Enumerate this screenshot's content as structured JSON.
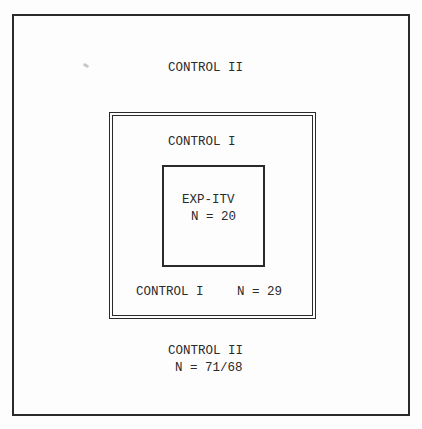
{
  "diagram": {
    "type": "nested-boxes",
    "regions": {
      "outer": {
        "top_label": "CONTROL II",
        "bottom_label": "CONTROL II",
        "bottom_n": "N = 71/68"
      },
      "middle": {
        "top_label": "CONTROL I",
        "bottom_label": "CONTROL I",
        "bottom_n": "N = 29"
      },
      "inner": {
        "label": "EXP-ITV",
        "n": "N = 20"
      }
    },
    "colors": {
      "line": "#2a2a2a",
      "background": "#fdfdfd"
    }
  }
}
